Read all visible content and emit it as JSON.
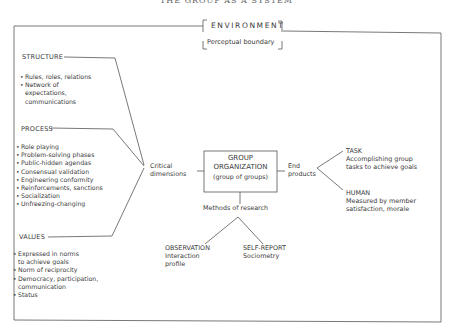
{
  "title": "THE GROUP AS A SYSTEM",
  "environment": {
    "title": "ENVIRONMENT",
    "subtitle": "Perceptual boundary"
  },
  "structure": {
    "heading": "STRUCTURE",
    "items": [
      "Rules, roles, relations",
      "Network of\nexpectations,\ncommunications"
    ]
  },
  "process": {
    "heading": "PROCESS",
    "items": [
      "Role playing",
      "Problem-solving phases",
      "Public-hidden agendas",
      "Consensual validation",
      "Engineering conformity",
      "Reinforcements, sanctions",
      "Socialization",
      "Unfreezing-changing"
    ]
  },
  "values": {
    "heading": "VALUES",
    "items": [
      "Expressed in norms\nto achieve goals",
      "Norm of reciprocity",
      "Democracy, participation,\ncommunication",
      "Status"
    ]
  },
  "critical_dimensions": {
    "line1": "Critical",
    "line2": "dimensions"
  },
  "group_organization": {
    "line1": "GROUP",
    "line2": "ORGANIZATION",
    "line3": "(group of groups)"
  },
  "end_products": {
    "line1": "End",
    "line2": "products",
    "task": {
      "heading": "TASK",
      "line1": "Accomplishing group",
      "line2": "tasks to achieve goals"
    },
    "human": {
      "heading": "HUMAN",
      "line1": "Measured by member",
      "line2": "satisfaction, morale"
    }
  },
  "methods_of_research": {
    "label": "Methods of research",
    "observation": {
      "heading": "OBSERVATION",
      "line1": "Interaction",
      "line2": "profile"
    },
    "self_report": {
      "heading": "SELF-REPORT",
      "line1": "Sociometry"
    }
  }
}
